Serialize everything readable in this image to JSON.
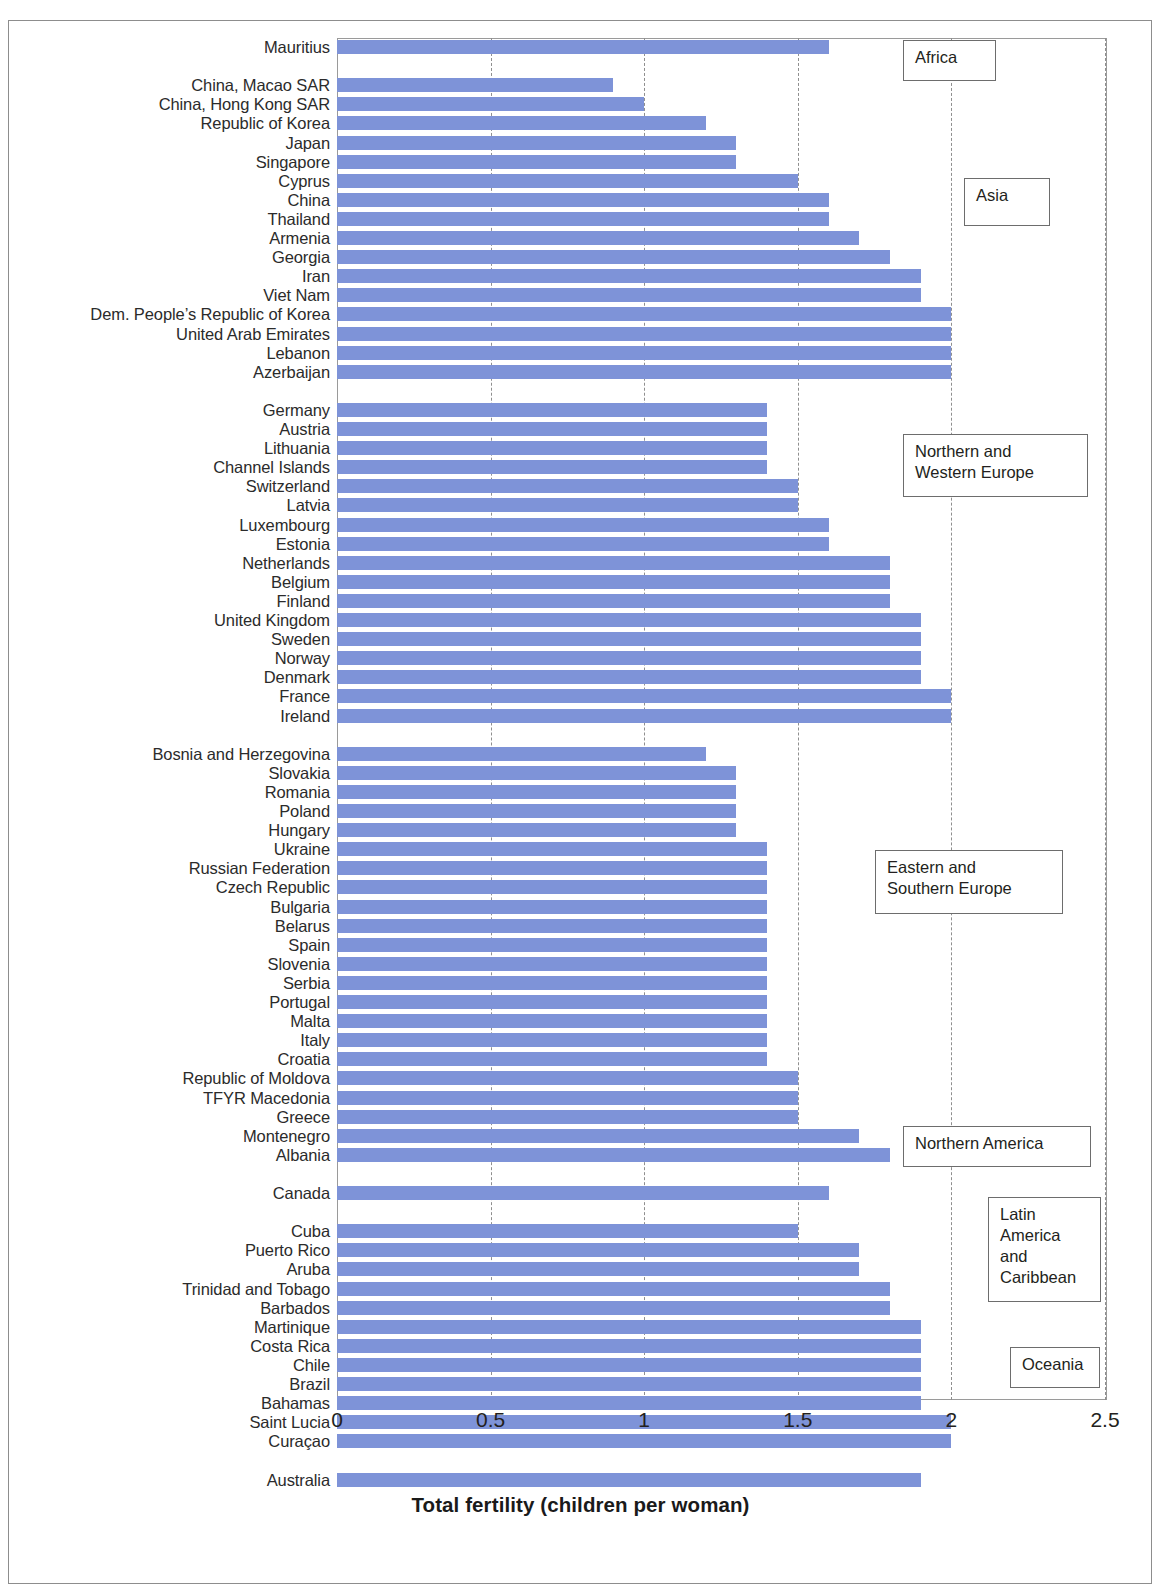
{
  "chart_data": {
    "type": "bar",
    "orientation": "horizontal",
    "title": "",
    "xlabel": "Total fertility (children per woman)",
    "ylabel": "",
    "xlim": [
      0,
      2.5
    ],
    "xticks": [
      "0",
      "0.5",
      "1",
      "1.5",
      "2",
      "2.5"
    ],
    "xtick_values": [
      0,
      0.5,
      1,
      1.5,
      2,
      2.5
    ],
    "grid": "vertical-dashed",
    "bar_color": "#7e93d8",
    "legend_position": "inline-callout-boxes",
    "groups": [
      {
        "region": "Africa",
        "categories": [
          "Mauritius"
        ],
        "values": [
          1.6
        ]
      },
      {
        "region": "Asia",
        "categories": [
          "China, Macao SAR",
          "China, Hong Kong SAR",
          "Republic of Korea",
          "Japan",
          "Singapore",
          "Cyprus",
          "China",
          "Thailand",
          "Armenia",
          "Georgia",
          "Iran",
          "Viet Nam",
          "Dem. People’s Republic of Korea",
          "United Arab Emirates",
          "Lebanon",
          "Azerbaijan"
        ],
        "values": [
          0.9,
          1.0,
          1.2,
          1.3,
          1.3,
          1.5,
          1.6,
          1.6,
          1.7,
          1.8,
          1.9,
          1.9,
          2.0,
          2.0,
          2.0,
          2.0
        ]
      },
      {
        "region": "Northern and\nWestern Europe",
        "categories": [
          "Germany",
          "Austria",
          "Lithuania",
          "Channel Islands",
          "Switzerland",
          "Latvia",
          "Luxembourg",
          "Estonia",
          "Netherlands",
          "Belgium",
          "Finland",
          "United Kingdom",
          "Sweden",
          "Norway",
          "Denmark",
          "France",
          "Ireland"
        ],
        "values": [
          1.4,
          1.4,
          1.4,
          1.4,
          1.5,
          1.5,
          1.6,
          1.6,
          1.8,
          1.8,
          1.8,
          1.9,
          1.9,
          1.9,
          1.9,
          2.0,
          2.0
        ]
      },
      {
        "region": "Eastern and\nSouthern Europe",
        "categories": [
          "Bosnia and Herzegovina",
          "Slovakia",
          "Romania",
          "Poland",
          "Hungary",
          "Ukraine",
          "Russian Federation",
          "Czech Republic",
          "Bulgaria",
          "Belarus",
          "Spain",
          "Slovenia",
          "Serbia",
          "Portugal",
          "Malta",
          "Italy",
          "Croatia",
          "Republic of Moldova",
          "TFYR Macedonia",
          "Greece",
          "Montenegro",
          "Albania"
        ],
        "values": [
          1.2,
          1.3,
          1.3,
          1.3,
          1.3,
          1.4,
          1.4,
          1.4,
          1.4,
          1.4,
          1.4,
          1.4,
          1.4,
          1.4,
          1.4,
          1.4,
          1.4,
          1.5,
          1.5,
          1.5,
          1.7,
          1.8
        ]
      },
      {
        "region": "Northern America",
        "categories": [
          "Canada"
        ],
        "values": [
          1.6
        ]
      },
      {
        "region": "Latin\nAmerica\nand\nCaribbean",
        "categories": [
          "Cuba",
          "Puerto Rico",
          "Aruba",
          "Trinidad and Tobago",
          "Barbados",
          "Martinique",
          "Costa Rica",
          "Chile",
          "Brazil",
          "Bahamas",
          "Saint Lucia",
          "Curaçao"
        ],
        "values": [
          1.5,
          1.7,
          1.7,
          1.8,
          1.8,
          1.9,
          1.9,
          1.9,
          1.9,
          1.9,
          2.0,
          2.0
        ]
      },
      {
        "region": "Oceania",
        "categories": [
          "Australia"
        ],
        "values": [
          1.9
        ]
      }
    ]
  },
  "regions": {
    "africa": "Africa",
    "asia": "Asia",
    "nw_europe": "Northern and\nWestern Europe",
    "es_europe": "Eastern and\nSouthern Europe",
    "n_america": "Northern America",
    "latin_america": "Latin\nAmerica\nand\nCaribbean",
    "oceania": "Oceania"
  },
  "axis": {
    "x_title": "Total fertility (children per woman)",
    "x_ticks": [
      "0",
      "0.5",
      "1",
      "1.5",
      "2",
      "2.5"
    ]
  }
}
